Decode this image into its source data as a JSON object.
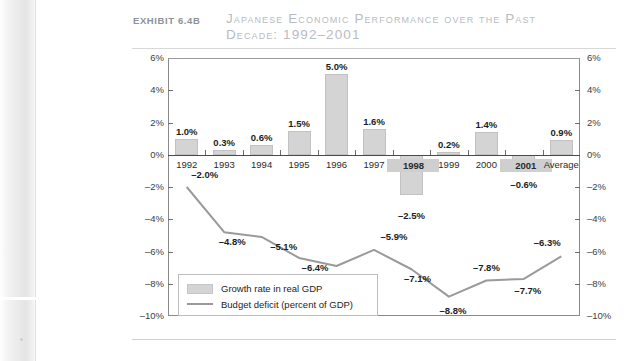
{
  "exhibit": {
    "label": "Exhibit 6.4b"
  },
  "header": {
    "title_line1": "Japanese Economic Performance over the Past",
    "title_line2": "Decade: 1992–2001"
  },
  "legend": {
    "bar_label": "Growth rate in real GDP",
    "line_label": "Budget deficit (percent of GDP)"
  },
  "colors": {
    "bar_fill": "#d4d4d4",
    "line_stroke": "#9a9a9a",
    "axis": "#8a8a8a",
    "title_text": "#b7bcc2",
    "label_text": "#8d9298"
  },
  "chart_data": {
    "type": "bar",
    "title": "Japanese Economic Performance over the Past Decade: 1992–2001",
    "xlabel": "",
    "ylabel": "",
    "ylim": [
      -10,
      6
    ],
    "yticks": [
      "6%",
      "4%",
      "2%",
      "0%",
      "–2%",
      "–4%",
      "–6%",
      "–8%",
      "–10%"
    ],
    "ytick_values": [
      6,
      4,
      2,
      0,
      -2,
      -4,
      -6,
      -8,
      -10
    ],
    "grid": false,
    "legend_position": "inside-bottom-left",
    "categories": [
      "1992",
      "1993",
      "1994",
      "1995",
      "1996",
      "1997",
      "1998",
      "1999",
      "2000",
      "2001",
      "Average"
    ],
    "highlighted_categories": [
      "1998",
      "2001"
    ],
    "series": [
      {
        "name": "Growth rate in real GDP",
        "type": "bar",
        "values": [
          1.0,
          0.3,
          0.6,
          1.5,
          5.0,
          1.6,
          -2.5,
          0.2,
          1.4,
          -0.6,
          0.9
        ],
        "labels": [
          "1.0%",
          "0.3%",
          "0.6%",
          "1.5%",
          "5.0%",
          "1.6%",
          "–2.5%",
          "0.2%",
          "1.4%",
          "–0.6%",
          "0.9%"
        ]
      },
      {
        "name": "Budget deficit (percent of GDP)",
        "type": "line",
        "values": [
          -2.0,
          -4.8,
          -5.1,
          -6.4,
          -6.9,
          -5.9,
          -7.1,
          -8.8,
          -7.8,
          -7.7,
          -6.3
        ],
        "labels": [
          "–2.0%",
          "–4.8%",
          "–5.1%",
          "–6.4%",
          "–6.9%",
          "–5.9%",
          "–7.1%",
          "–8.8%",
          "–7.8%",
          "–7.7%",
          "–6.3%"
        ]
      }
    ]
  }
}
